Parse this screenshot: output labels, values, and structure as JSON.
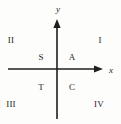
{
  "figure": {
    "type": "cartesian-quadrant-diagram",
    "background_color": "#fdfdfc",
    "line_color": "#1f1f1f",
    "text_color": "#262626",
    "width": 121,
    "height": 124
  },
  "axes": {
    "x_axis": {
      "label": "x",
      "arrow": "right",
      "start_x": 8,
      "end_x": 103,
      "y": 69
    },
    "y_axis": {
      "label": "y",
      "arrow": "up",
      "top_y": 19,
      "bottom_y": 119,
      "x": 57
    },
    "origin": {
      "x": 57,
      "y": 69
    }
  },
  "quadrants": [
    {
      "name": "quadrant-1",
      "roman": "I",
      "letter": "A",
      "roman_pos": {
        "x": 100,
        "y": 40
      },
      "letter_pos": {
        "x": 72,
        "y": 57
      }
    },
    {
      "name": "quadrant-2",
      "roman": "II",
      "letter": "S",
      "roman_pos": {
        "x": 11,
        "y": 40
      },
      "letter_pos": {
        "x": 41,
        "y": 57
      }
    },
    {
      "name": "quadrant-3",
      "roman": "III",
      "letter": "T",
      "roman_pos": {
        "x": 11,
        "y": 104
      },
      "letter_pos": {
        "x": 41,
        "y": 87
      }
    },
    {
      "name": "quadrant-4",
      "roman": "IV",
      "letter": "C",
      "roman_pos": {
        "x": 99,
        "y": 104
      },
      "letter_pos": {
        "x": 72,
        "y": 87
      }
    }
  ]
}
